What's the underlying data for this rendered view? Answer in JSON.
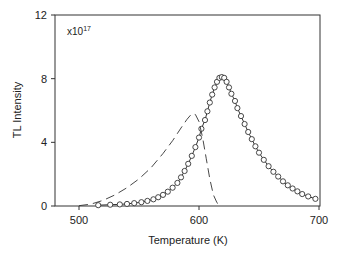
{
  "chart_data": {
    "type": "line",
    "title": "",
    "xlabel": "Temperature (K)",
    "ylabel": "TL Intensity",
    "multiplier_label": "x10",
    "multiplier_exp": "17",
    "xlim": [
      480,
      700
    ],
    "ylim": [
      0,
      12
    ],
    "xticks": [
      500,
      600,
      700
    ],
    "yticks": [
      0,
      4,
      8,
      12
    ],
    "grid": false,
    "legend": "none",
    "series": [
      {
        "name": "measured (circles)",
        "style": "solid-line-with-open-circles",
        "x": [
          516,
          526,
          534,
          540,
          546,
          552,
          557,
          562,
          566,
          570,
          574,
          578,
          582,
          585,
          588,
          591,
          594,
          597,
          600,
          602,
          605,
          607,
          609,
          611,
          613,
          615,
          617,
          619,
          621,
          623,
          625,
          627,
          630,
          632,
          635,
          638,
          641,
          644,
          647,
          650,
          654,
          658,
          662,
          666,
          670,
          674,
          678,
          682,
          686,
          691,
          697
        ],
        "y": [
          0.05,
          0.08,
          0.1,
          0.13,
          0.18,
          0.24,
          0.32,
          0.42,
          0.55,
          0.7,
          0.9,
          1.15,
          1.45,
          1.8,
          2.2,
          2.65,
          3.15,
          3.7,
          4.3,
          4.85,
          5.4,
          5.95,
          6.5,
          7.0,
          7.45,
          7.8,
          8.05,
          8.1,
          8.05,
          7.8,
          7.45,
          7.05,
          6.6,
          6.15,
          5.65,
          5.15,
          4.65,
          4.2,
          3.75,
          3.35,
          2.9,
          2.5,
          2.15,
          1.85,
          1.55,
          1.3,
          1.1,
          0.92,
          0.75,
          0.6,
          0.45
        ]
      },
      {
        "name": "calculated (dashed)",
        "style": "dashed-line",
        "x": [
          500,
          510,
          520,
          530,
          540,
          550,
          560,
          570,
          578,
          585,
          590,
          594,
          597,
          600,
          603,
          606,
          609,
          612,
          615,
          618
        ],
        "y": [
          0.02,
          0.12,
          0.35,
          0.7,
          1.15,
          1.7,
          2.4,
          3.3,
          4.1,
          4.9,
          5.45,
          5.8,
          5.75,
          5.3,
          4.3,
          3.0,
          1.7,
          0.7,
          0.2,
          0.0
        ]
      }
    ]
  }
}
